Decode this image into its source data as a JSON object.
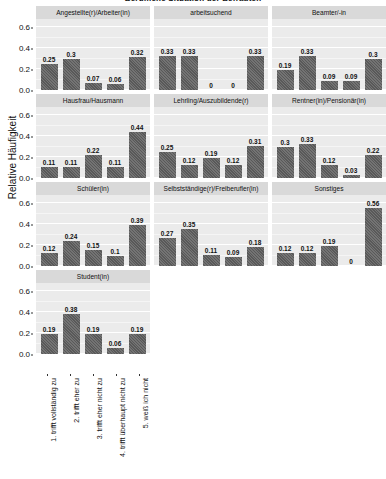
{
  "chart_data": {
    "type": "bar",
    "title": "Berufliche Situation der Befragten",
    "ylabel": "Relative Häufigkeit",
    "xlabel": "",
    "ylim": [
      0,
      0.68
    ],
    "yticks": [
      "0.0",
      "0.2",
      "0.4",
      "0.6"
    ],
    "ytick_values": [
      0.0,
      0.2,
      0.4,
      0.6
    ],
    "grid": true,
    "legend": "none",
    "facet_layout": {
      "rows": 4,
      "cols": 3
    },
    "categories": [
      "1. trifft vollständig zu",
      "2. trifft eher zu",
      "3. trifft eher nicht zu",
      "4. trifft überhaupt nicht zu",
      "5. weiß ich nicht"
    ],
    "panels": [
      {
        "title": "Angestellte(r)/Arbeiter(in)",
        "values": [
          0.25,
          0.3,
          0.07,
          0.06,
          0.32
        ],
        "labels": [
          "0.25",
          "0.3",
          "0.07",
          "0.06",
          "0.32"
        ]
      },
      {
        "title": "arbeitsuchend",
        "values": [
          0.33,
          0.33,
          0,
          0,
          0.33
        ],
        "labels": [
          "0.33",
          "0.33",
          "0",
          "0",
          "0.33"
        ]
      },
      {
        "title": "Beamter/-in",
        "values": [
          0.19,
          0.33,
          0.09,
          0.09,
          0.3
        ],
        "labels": [
          "0.19",
          "0.33",
          "0.09",
          "0.09",
          "0.3"
        ]
      },
      {
        "title": "Hausfrau/Hausmann",
        "values": [
          0.11,
          0.11,
          0.22,
          0.11,
          0.44
        ],
        "labels": [
          "0.11",
          "0.11",
          "0.22",
          "0.11",
          "0.44"
        ]
      },
      {
        "title": "Lehrling/Auszubildende(r)",
        "values": [
          0.25,
          0.12,
          0.19,
          0.12,
          0.31
        ],
        "labels": [
          "0.25",
          "0.12",
          "0.19",
          "0.12",
          "0.31"
        ]
      },
      {
        "title": "Rentner(in)/Pensionär(in)",
        "values": [
          0.3,
          0.33,
          0.12,
          0.03,
          0.22
        ],
        "labels": [
          "0.3",
          "0.33",
          "0.12",
          "0.03",
          "0.22"
        ]
      },
      {
        "title": "Schüler(in)",
        "values": [
          0.12,
          0.24,
          0.15,
          0.1,
          0.39
        ],
        "labels": [
          "0.12",
          "0.24",
          "0.15",
          "0.1",
          "0.39"
        ]
      },
      {
        "title": "Selbstständige(r)/Freiberufler(in)",
        "values": [
          0.27,
          0.35,
          0.11,
          0.09,
          0.18
        ],
        "labels": [
          "0.27",
          "0.35",
          "0.11",
          "0.09",
          "0.18"
        ]
      },
      {
        "title": "Sonstiges",
        "values": [
          0.12,
          0.12,
          0.19,
          0,
          0.56
        ],
        "labels": [
          "0.12",
          "0.12",
          "0.19",
          "0",
          "0.56"
        ]
      },
      {
        "title": "Student(in)",
        "values": [
          0.19,
          0.38,
          0.19,
          0.06,
          0.19
        ],
        "labels": [
          "0.19",
          "0.38",
          "0.19",
          "0.06",
          "0.19"
        ]
      }
    ],
    "colors": {
      "bar": "#595959",
      "panel_background": "#ebebeb",
      "strip_background": "#d9d9d9",
      "gridline": "#ffffff",
      "text": "#111111"
    }
  }
}
